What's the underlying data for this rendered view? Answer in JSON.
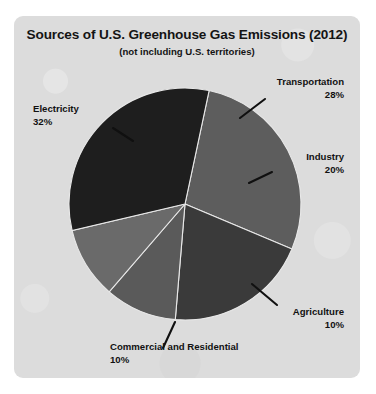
{
  "chart_data": {
    "type": "pie",
    "title": "Sources of U.S. Greenhouse Gas Emissions (2012)",
    "subtitle": "(not including  U.S. territories)",
    "units": "percent",
    "total": 100,
    "legend": "none (direct labels with leader lines)",
    "grid": false,
    "categories": [
      "Transportation",
      "Industry",
      "Agriculture",
      "Commercial and Residential",
      "Electricity"
    ],
    "values": [
      28,
      20,
      10,
      10,
      32
    ],
    "slices": [
      {
        "label": "Transportation",
        "value": 28,
        "pct_text": "28%",
        "color": "#5d5d5d",
        "start_angle": -78,
        "end_angle": 22.8
      },
      {
        "label": "Industry",
        "value": 20,
        "pct_text": "20%",
        "color": "#3a3a3a",
        "start_angle": 22.8,
        "end_angle": 94.8
      },
      {
        "label": "Agriculture",
        "value": 10,
        "pct_text": "10%",
        "color": "#5a5a5a",
        "start_angle": 94.8,
        "end_angle": 130.8
      },
      {
        "label": "Commercial and Residential",
        "value": 10,
        "pct_text": "10%",
        "color": "#6a6a6a",
        "start_angle": 130.8,
        "end_angle": 166.8
      },
      {
        "label": "Electricity",
        "value": 32,
        "pct_text": "32%",
        "color": "#1e1e1e",
        "start_angle": 166.8,
        "end_angle": 282
      }
    ]
  },
  "labels": {
    "transportation": {
      "name": "Transportation",
      "pct": "28%"
    },
    "industry": {
      "name": "Industry",
      "pct": "20%"
    },
    "electricity": {
      "name": "Electricity",
      "pct": "32%"
    },
    "agriculture": {
      "name": "Agriculture",
      "pct": "10%"
    },
    "commercial_residential": {
      "name": "Commercial and Residential",
      "pct": "10%"
    }
  },
  "colors": {
    "panel_background": "#dcdcdc",
    "page_background": "#ffffff",
    "text": "#111111",
    "leader_line": "#101010",
    "slice_separator": "#e8e8e8"
  }
}
